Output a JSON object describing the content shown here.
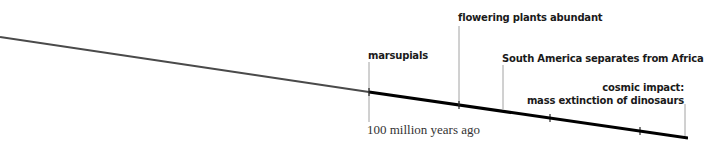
{
  "diagram": {
    "type": "timeline",
    "axis_label": "100 million years ago",
    "colors": {
      "past_line": "#4a4a4a",
      "recent_line": "#000000",
      "leader": "#8a8a8a",
      "text": "#1a1a1a"
    },
    "events": [
      {
        "label": "marsupials"
      },
      {
        "label": "flowering plants abundant"
      },
      {
        "label": "South America separates from Africa"
      },
      {
        "label_line1": "cosmic impact:",
        "label_line2": "mass extinction of dinosaurs"
      }
    ]
  }
}
